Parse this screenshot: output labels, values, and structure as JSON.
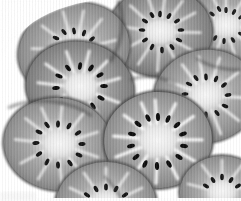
{
  "image": {
    "kind": "natural-photograph",
    "subject": "kiwifruit slices",
    "description": "Close-up grayscale photograph of many overlapping round kiwi fruit slices filling the frame",
    "color_mode": "grayscale",
    "width_px": 241,
    "height_px": 201,
    "background_color": "#ffffff",
    "background_visible_regions": [
      "top-left-corner",
      "bottom-edge-strip"
    ],
    "palette": {
      "background": "#fdfdfd",
      "flesh_mid": "#9a9a9a",
      "flesh_dark": "#6d6d6d",
      "rind_edge": "#585858",
      "core_pale": "#e6e6e6",
      "ray_white": "#f2f2f2",
      "seed_black": "#1b1b1b",
      "shadow": "#4a4a4a"
    },
    "slice_count": 8,
    "slices": [
      {
        "id": "slice-top-left",
        "label": "upper-left slice",
        "cx": 74,
        "cy": 52,
        "rx": 56,
        "ry": 46,
        "rotation": -16,
        "core_rx": 17,
        "core_ry": 13,
        "seed_count": 20,
        "seed_ring_radius": 0.56,
        "flesh_tone": "#909090",
        "core_tone": "#dcdcdc"
      },
      {
        "id": "slice-top-mid",
        "label": "upper-middle slice",
        "cx": 160,
        "cy": 34,
        "rx": 52,
        "ry": 44,
        "rotation": 8,
        "core_rx": 16,
        "core_ry": 12,
        "seed_count": 20,
        "seed_ring_radius": 0.55,
        "flesh_tone": "#8a8a8a",
        "core_tone": "#dadada"
      },
      {
        "id": "slice-top-right",
        "label": "upper-right slice",
        "cx": 226,
        "cy": 26,
        "rx": 46,
        "ry": 40,
        "rotation": -6,
        "core_rx": 14,
        "core_ry": 11,
        "seed_count": 18,
        "seed_ring_radius": 0.55,
        "flesh_tone": "#979797",
        "core_tone": "#e2e2e2"
      },
      {
        "id": "slice-center",
        "label": "central slice",
        "cx": 80,
        "cy": 88,
        "rx": 54,
        "ry": 46,
        "rotation": 14,
        "core_rx": 19,
        "core_ry": 14,
        "seed_count": 22,
        "seed_ring_radius": 0.52,
        "flesh_tone": "#8d8d8d",
        "core_tone": "#ececec"
      },
      {
        "id": "slice-right-mid",
        "label": "right middle slice",
        "cx": 206,
        "cy": 96,
        "rx": 52,
        "ry": 46,
        "rotation": -10,
        "core_rx": 17,
        "core_ry": 13,
        "seed_count": 20,
        "seed_ring_radius": 0.55,
        "flesh_tone": "#8f8f8f",
        "core_tone": "#e0e0e0"
      },
      {
        "id": "slice-left-low",
        "label": "lower-left slice",
        "cx": 58,
        "cy": 144,
        "rx": 54,
        "ry": 46,
        "rotation": 6,
        "core_rx": 18,
        "core_ry": 13,
        "seed_count": 20,
        "seed_ring_radius": 0.54,
        "flesh_tone": "#949494",
        "core_tone": "#e4e4e4"
      },
      {
        "id": "slice-center-low",
        "label": "lower-middle slice",
        "cx": 158,
        "cy": 140,
        "rx": 54,
        "ry": 48,
        "rotation": -4,
        "core_rx": 20,
        "core_ry": 15,
        "seed_count": 24,
        "seed_ring_radius": 0.52,
        "flesh_tone": "#8b8b8b",
        "core_tone": "#eeeeee"
      },
      {
        "id": "slice-bottom",
        "label": "bottom edge slice",
        "cx": 126,
        "cy": 204,
        "rx": 50,
        "ry": 42,
        "rotation": 2,
        "core_rx": 16,
        "core_ry": 12,
        "seed_count": 18,
        "seed_ring_radius": 0.55,
        "flesh_tone": "#999999",
        "core_tone": "#e2e2e2"
      }
    ],
    "text_overlays": []
  }
}
